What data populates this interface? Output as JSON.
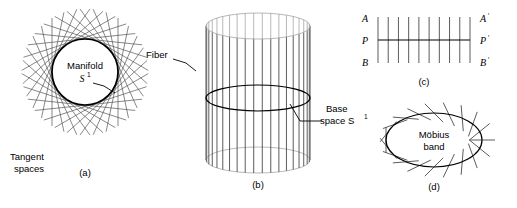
{
  "figure": {
    "background_color": "#ffffff",
    "ink_color": "#000000",
    "thin_line_color": "#555555",
    "panels": [
      {
        "id": "a",
        "letter": "(a)",
        "type": "circle-with-tangent-envelope",
        "labels": [
          {
            "name": "manifold-label",
            "line1": "Manifold",
            "line2_base": "S",
            "line2_sup": "1"
          },
          {
            "name": "tangent-spaces-label",
            "line1": "Tangent",
            "line2": "spaces"
          }
        ],
        "geometry": {
          "center_x": 85,
          "center_y": 72,
          "circle_radius": 33,
          "tangent_line_count": 30,
          "tangent_extent": 54
        }
      },
      {
        "id": "b",
        "letter": "(b)",
        "type": "cylinder-fiber-bundle",
        "labels": [
          {
            "name": "fiber-label",
            "text": "Fiber"
          },
          {
            "name": "base-space-label",
            "line1": "Base",
            "line2_base": "space S",
            "line2_sup": "1"
          }
        ],
        "geometry": {
          "center_x": 258,
          "top_y": 26,
          "bottom_y": 160,
          "radius_x": 52,
          "radius_y": 13,
          "fiber_count": 19,
          "base_circle_y": 98
        }
      },
      {
        "id": "c",
        "letter": "(c)",
        "type": "trivial-bundle-strip",
        "labels": [
          {
            "name": "corner-label-a",
            "base": "A",
            "prime": ""
          },
          {
            "name": "corner-label-a-prime",
            "base": "A",
            "prime": "′"
          },
          {
            "name": "midpoint-label-p",
            "base": "P",
            "prime": ""
          },
          {
            "name": "midpoint-label-p-prime",
            "base": "P",
            "prime": "′"
          },
          {
            "name": "corner-label-b",
            "base": "B",
            "prime": ""
          },
          {
            "name": "corner-label-b-prime",
            "base": "B",
            "prime": "′"
          }
        ],
        "geometry": {
          "left_x": 378,
          "right_x": 470,
          "top_y": 17,
          "bottom_y": 63,
          "mid_y": 40,
          "vertical_line_count": 10
        }
      },
      {
        "id": "d",
        "letter": "(d)",
        "type": "mobius-band-ellipse",
        "labels": [
          {
            "name": "mobius-band-label",
            "line1": "Möbius",
            "line2": "band"
          }
        ],
        "geometry": {
          "center_x": 434,
          "center_y": 140,
          "radius_x": 48,
          "radius_y": 27,
          "fiber_count": 20,
          "fiber_half_length": 13
        }
      }
    ]
  }
}
